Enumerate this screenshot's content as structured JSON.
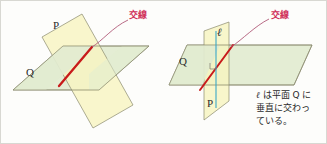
{
  "figure": {
    "background_color": "#fdfdfb",
    "border_color": "#d8d8d2"
  },
  "colors": {
    "plane_p_fill": "#f7f4c0",
    "plane_q_fill": "#e2ecd0",
    "plane_outline": "#8a8a6e",
    "intersection_red": "#c81b1b",
    "leader_line": "#b05a78",
    "callout_text": "#d0305a",
    "perpendicular_line_blue": "#3aa8c8",
    "label_text": "#2a2a2a"
  },
  "left_diagram": {
    "name": "two-planes-intersecting",
    "plane_p_label": "P",
    "plane_q_label": "Q",
    "callout_label": "交線",
    "intersection_color": "#c81b1b"
  },
  "right_diagram": {
    "name": "line-perpendicular-to-plane",
    "plane_p_label": "P",
    "plane_q_label": "Q",
    "line_label": "ℓ",
    "callout_label": "交線",
    "intersection_color": "#c81b1b",
    "perpendicular_color": "#3aa8c8"
  },
  "caption": {
    "line1_pre": "ℓ",
    "line1_post": " は平面 Q に",
    "line2": "垂直に交わっ",
    "line3": "ている。",
    "full_text": "ℓ は平面 Q に垂直に交わっている。"
  }
}
